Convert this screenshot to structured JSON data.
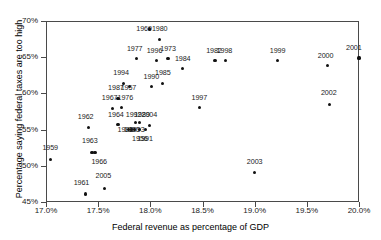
{
  "chart_data": {
    "type": "scatter",
    "title": "",
    "xlabel": "Federal revenue as percentage of GDP",
    "ylabel": "Percentage saying federal taxes are too high",
    "xlim": [
      17.0,
      20.0
    ],
    "ylim": [
      45,
      70
    ],
    "xticks": [
      "17.0%",
      "17.5%",
      "18.0%",
      "18.5%",
      "19.0%",
      "19.5%",
      "20.0%"
    ],
    "xtick_values": [
      17.0,
      17.5,
      18.0,
      18.5,
      19.0,
      19.5,
      20.0
    ],
    "yticks": [
      "45%",
      "50%",
      "55%",
      "60%",
      "65%",
      "70%"
    ],
    "ytick_values": [
      45,
      50,
      55,
      60,
      65,
      70
    ],
    "grid": false,
    "legend": "none",
    "marker_color": "#111111",
    "axis_color": "#4a4a4a",
    "points": [
      {
        "label": "1959",
        "x": 17.04,
        "y": 50.9,
        "lx": 17.04,
        "ly": 52.4
      },
      {
        "label": "1961",
        "x": 17.38,
        "y": 46.1,
        "lx": 17.34,
        "ly": 47.6
      },
      {
        "label": "1962",
        "x": 17.41,
        "y": 55.3,
        "lx": 17.38,
        "ly": 56.8
      },
      {
        "label": "1963",
        "x": 17.44,
        "y": 51.8,
        "lx": 17.42,
        "ly": 53.4
      },
      {
        "label": "1966",
        "x": 17.47,
        "y": 51.8,
        "lx": 17.51,
        "ly": 50.5
      },
      {
        "label": "2005",
        "x": 17.56,
        "y": 46.9,
        "lx": 17.55,
        "ly": 48.6
      },
      {
        "label": "1967",
        "x": 17.64,
        "y": 57.9,
        "lx": 17.61,
        "ly": 59.3
      },
      {
        "label": "1987",
        "x": 17.69,
        "y": 59.3,
        "lx": 17.67,
        "ly": 60.7
      },
      {
        "label": "1964",
        "x": 17.69,
        "y": 55.7,
        "lx": 17.67,
        "ly": 57.0
      },
      {
        "label": "1976",
        "x": 17.72,
        "y": 58.0,
        "lx": 17.76,
        "ly": 59.3
      },
      {
        "label": "1994",
        "x": 17.74,
        "y": 61.4,
        "lx": 17.72,
        "ly": 62.8
      },
      {
        "label": "1988",
        "x": 17.79,
        "y": 55.0,
        "lx": 17.76,
        "ly": 55.0
      },
      {
        "label": "1990",
        "x": 17.82,
        "y": 55.0,
        "lx": 17.82,
        "ly": 55.0
      },
      {
        "label": "1957",
        "x": 17.8,
        "y": 60.9,
        "lx": 17.79,
        "ly": 60.7
      },
      {
        "label": "1993",
        "x": 17.85,
        "y": 55.0,
        "lx": 17.87,
        "ly": 55.0
      },
      {
        "label": "1992",
        "x": 17.86,
        "y": 56.0,
        "lx": 17.84,
        "ly": 57.0
      },
      {
        "label": "1956",
        "x": 17.9,
        "y": 55.0,
        "lx": 17.9,
        "ly": 53.7
      },
      {
        "label": "1989",
        "x": 17.9,
        "y": 56.0,
        "lx": 17.92,
        "ly": 57.0
      },
      {
        "label": "1991",
        "x": 17.95,
        "y": 55.0,
        "lx": 17.95,
        "ly": 53.7
      },
      {
        "label": "1977",
        "x": 17.87,
        "y": 64.8,
        "lx": 17.85,
        "ly": 66.2
      },
      {
        "label": "2004",
        "x": 17.99,
        "y": 55.6,
        "lx": 17.99,
        "ly": 57.0
      },
      {
        "label": "1969",
        "x": 17.99,
        "y": 68.9,
        "lx": 17.94,
        "ly": 68.9
      },
      {
        "label": "1990b",
        "x": 18.01,
        "y": 60.9,
        "lx": 18.01,
        "ly": 62.3
      },
      {
        "label": "1996",
        "x": 18.06,
        "y": 64.5,
        "lx": 18.04,
        "ly": 65.9
      },
      {
        "label": "1980",
        "x": 18.09,
        "y": 67.5,
        "lx": 18.09,
        "ly": 68.9
      },
      {
        "label": "1985",
        "x": 18.12,
        "y": 61.4,
        "lx": 18.12,
        "ly": 62.8
      },
      {
        "label": "1973",
        "x": 18.17,
        "y": 64.8,
        "lx": 18.17,
        "ly": 66.2
      },
      {
        "label": "1984",
        "x": 18.31,
        "y": 63.4,
        "lx": 18.31,
        "ly": 64.8
      },
      {
        "label": "1997",
        "x": 18.47,
        "y": 58.0,
        "lx": 18.47,
        "ly": 59.4
      },
      {
        "label": "1982",
        "x": 18.62,
        "y": 64.5,
        "lx": 18.61,
        "ly": 65.9
      },
      {
        "label": "1998",
        "x": 18.72,
        "y": 64.5,
        "lx": 18.71,
        "ly": 65.9
      },
      {
        "label": "2003",
        "x": 19.0,
        "y": 49.1,
        "lx": 19.0,
        "ly": 50.5
      },
      {
        "label": "1999",
        "x": 19.22,
        "y": 64.5,
        "lx": 19.22,
        "ly": 65.9
      },
      {
        "label": "2000",
        "x": 19.7,
        "y": 63.8,
        "lx": 19.68,
        "ly": 65.2
      },
      {
        "label": "2002",
        "x": 19.72,
        "y": 58.5,
        "lx": 19.71,
        "ly": 60.0
      },
      {
        "label": "2001",
        "x": 20.0,
        "y": 64.9,
        "lx": 19.95,
        "ly": 66.3
      }
    ]
  }
}
